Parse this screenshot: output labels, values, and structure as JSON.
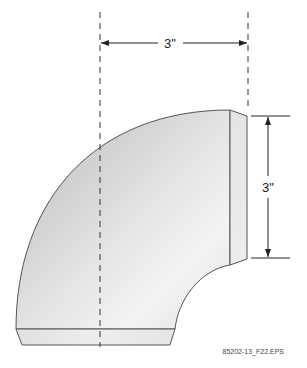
{
  "figure": {
    "horizontal_dimension": {
      "label": "3\""
    },
    "vertical_dimension": {
      "label": "3\""
    },
    "file_label": "85202-13_F22.EPS"
  },
  "colors": {
    "outline": "#555555",
    "fill_light": "#f2f2f2",
    "fill_dark": "#bdbdbd",
    "dim_line": "#222222"
  }
}
